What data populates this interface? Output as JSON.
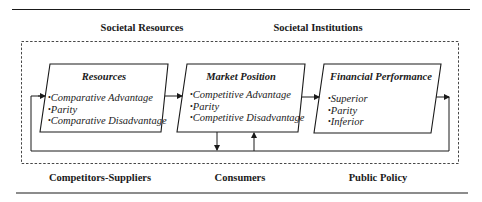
{
  "top_labels": {
    "left": "Societal Resources",
    "right": "Societal Institutions"
  },
  "bottom_labels": {
    "left": "Competitors-Suppliers",
    "center": "Consumers",
    "right": "Public Policy"
  },
  "boxes": [
    {
      "title": "Resources",
      "items": [
        "Comparative Advantage",
        "Parity",
        "Comparative Disadvantage"
      ]
    },
    {
      "title": "Market Position",
      "items": [
        "Competitive Advantage",
        "Parity",
        "Competitive Disadvantage"
      ]
    },
    {
      "title": "Financial Performance",
      "items": [
        "Superior",
        "Parity",
        "Inferior"
      ]
    }
  ],
  "colors": {
    "line": "#1a1a1a",
    "background": "#ffffff"
  }
}
